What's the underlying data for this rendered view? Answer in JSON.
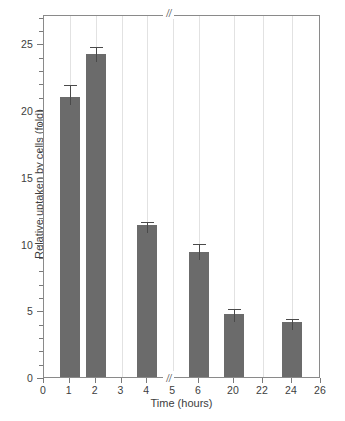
{
  "chart_data": {
    "type": "bar",
    "title": "",
    "xlabel": "Time (hours)",
    "ylabel": "Relative uptaken by cells (fold)",
    "categories": [
      "1",
      "2",
      "4",
      "6",
      "20",
      "24"
    ],
    "x": [
      1,
      2,
      4,
      6,
      20,
      24
    ],
    "values": [
      21.0,
      24.2,
      11.4,
      9.4,
      4.7,
      4.1
    ],
    "errors": [
      1.0,
      0.7,
      0.4,
      0.75,
      0.55,
      0.4
    ],
    "series": [
      {
        "name": "Relative uptaken by cells (fold)",
        "values": [
          21.0,
          24.2,
          11.4,
          9.4,
          4.7,
          4.1
        ],
        "errors": [
          1.0,
          0.7,
          0.4,
          0.75,
          0.55,
          0.4
        ]
      }
    ],
    "xlim": [
      0,
      26
    ],
    "ylim": [
      0,
      27.2
    ],
    "xticks": [
      0,
      1,
      2,
      3,
      4,
      5,
      6,
      20,
      22,
      24,
      26
    ],
    "xticklabels": [
      "0",
      "1",
      "2",
      "3",
      "4",
      "5",
      "6",
      "20",
      "22",
      "24",
      "26"
    ],
    "yticks": [
      0,
      5,
      10,
      15,
      20,
      25
    ],
    "yticklabels": [
      "0",
      "5",
      "10",
      "15",
      "20",
      "25"
    ],
    "yminorticks": [
      1,
      2,
      3,
      4,
      6,
      7,
      8,
      9,
      11,
      12,
      13,
      14,
      16,
      17,
      18,
      19,
      21,
      22,
      23,
      24,
      26,
      27
    ],
    "grid": "vertical",
    "legend": "none",
    "axis_break": {
      "axis": "x",
      "symbol": "//",
      "between": [
        6,
        20
      ],
      "marks": [
        "top",
        "bottom"
      ]
    },
    "bar_color": "#6b6b6b",
    "error_color": "#4a4a4a",
    "grid_color": "#e2e2e2",
    "axis_color": "#8a8a8a",
    "text_color": "#3d3d3d",
    "background": "#ffffff"
  }
}
